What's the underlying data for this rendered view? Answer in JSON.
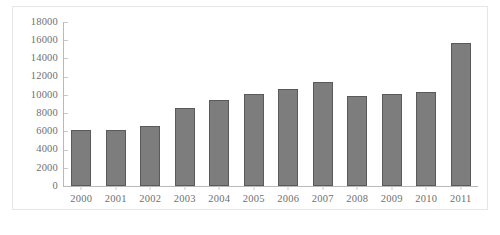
{
  "figure": {
    "background_color": "#ffffff",
    "frame_color": "#e6e6e6",
    "axis_color": "#b9b9b9",
    "bar_fill_color": "#7d7d7d",
    "bar_border_color": "#5a5a5a",
    "tick_label_color": "#6f6f6f"
  },
  "caption": {
    "text": ""
  },
  "chart_data": {
    "type": "bar",
    "title": "",
    "subtitle": "",
    "xlabel": "",
    "ylabel": "",
    "categories": [
      "2000",
      "2001",
      "2002",
      "2003",
      "2004",
      "2005",
      "2006",
      "2007",
      "2008",
      "2009",
      "2010",
      "2011"
    ],
    "values": [
      6100,
      6150,
      6550,
      8600,
      9450,
      10050,
      10600,
      11400,
      9900,
      10050,
      10350,
      15650
    ],
    "ylim": [
      0,
      18000
    ],
    "yticks": [
      0,
      2000,
      4000,
      6000,
      8000,
      10000,
      12000,
      14000,
      16000,
      18000
    ],
    "ytick_labels": [
      "0",
      "2000",
      "4000",
      "6000",
      "8000",
      "10000",
      "12000",
      "14000",
      "16000",
      "18000"
    ],
    "grid": false,
    "legend": null,
    "legend_position": "none",
    "annotations": []
  }
}
